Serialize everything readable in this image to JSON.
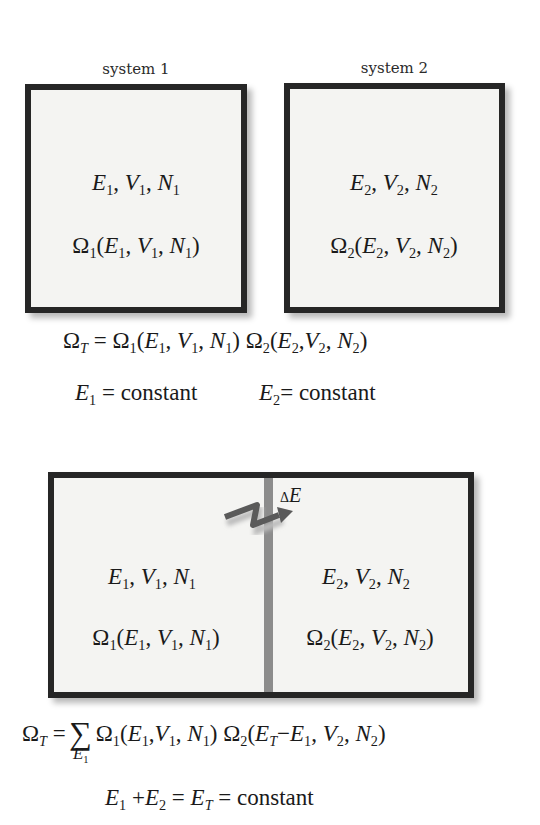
{
  "top_diagram": {
    "system1": {
      "label": "system 1",
      "state": {
        "E": "E",
        "V": "V",
        "N": "N",
        "sub": "1"
      },
      "omega": {
        "symbol": "Ω",
        "sub": "1"
      }
    },
    "system2": {
      "label": "system 2",
      "state": {
        "E": "E",
        "V": "V",
        "N": "N",
        "sub": "2"
      },
      "omega": {
        "symbol": "Ω",
        "sub": "2"
      }
    },
    "equation_total": {
      "lhs": "Ω",
      "lhs_sub": "T",
      "eq": "=",
      "factor1_sub": "1",
      "factor2_sub": "2"
    },
    "constraints": [
      {
        "var": "E",
        "sub": "1",
        "text": "= constant"
      },
      {
        "var": "E",
        "sub": "2",
        "text": "= constant"
      }
    ]
  },
  "bottom_diagram": {
    "left": {
      "sub": "1"
    },
    "right": {
      "sub": "2"
    },
    "exchange_label": {
      "delta": "Δ",
      "var": "E"
    },
    "wall_color": "#8c8c8c",
    "arrow_color": "#5a5a5a",
    "equation_total": {
      "lhs": "Ω",
      "lhs_sub": "T",
      "eq": "=",
      "sum": "∑",
      "sum_index": "E",
      "sum_index_sub": "1",
      "second_arg": "E",
      "second_arg_sub": "T",
      "minus": "−",
      "minus_var": "E",
      "minus_var_sub": "1"
    },
    "constraint": {
      "E1": "E",
      "E1_sub": "1",
      "plus": "+",
      "E2": "E",
      "E2_sub": "2",
      "eq": "=",
      "ET": "E",
      "ET_sub": "T",
      "text": "= constant"
    }
  },
  "colors": {
    "border": "#262626",
    "fill": "#f4f4f2",
    "text": "#1a1a1a"
  }
}
